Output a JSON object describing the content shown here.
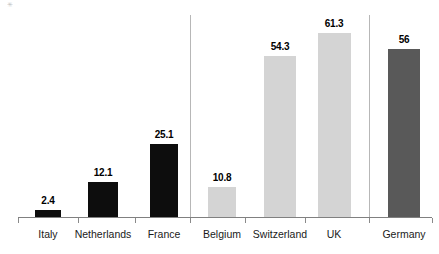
{
  "chart_data": {
    "type": "bar",
    "title": "",
    "subtitle": "",
    "xlabel": "",
    "ylabel": "",
    "ylim": [
      0,
      68
    ],
    "grid": false,
    "legend": "none",
    "categories": [
      "Italy",
      "Netherlands",
      "France",
      "Belgium",
      "Switzerland",
      "UK",
      "Germany"
    ],
    "values": [
      2.4,
      12.1,
      25.1,
      10.8,
      54.3,
      61.3,
      56
    ],
    "value_labels": [
      "2.4",
      "12.1",
      "25.1",
      "10.8",
      "54.3",
      "61.3",
      "56"
    ],
    "series": [
      {
        "name": "Value",
        "values": [
          2.4,
          12.1,
          25.1,
          10.8,
          54.3,
          61.3,
          56
        ]
      }
    ],
    "groups": [
      {
        "name": "group-1",
        "categories": [
          "Italy",
          "Netherlands",
          "France"
        ],
        "color": "#0d0d0d"
      },
      {
        "name": "group-2",
        "categories": [
          "Belgium",
          "Switzerland",
          "UK"
        ],
        "color": "#d4d4d4"
      },
      {
        "name": "group-3",
        "categories": [
          "Germany"
        ],
        "color": "#595959"
      }
    ],
    "bar_colors": [
      "#0d0d0d",
      "#0d0d0d",
      "#0d0d0d",
      "#d4d4d4",
      "#d4d4d4",
      "#d4d4d4",
      "#595959"
    ],
    "separators": [
      190,
      369
    ],
    "axis_color": "#808080",
    "separator_color": "#b7b7b7",
    "label_color": "#1a1a1a",
    "background": "#ffffff"
  },
  "bars": [
    {
      "label": "Italy",
      "value_label": "2.4",
      "x": 35,
      "width": 26,
      "top": 209,
      "color": "#0d0d0d",
      "label_x": 21,
      "label_w": 54,
      "label_y": 195
    },
    {
      "label": "Netherlands",
      "value_label": "12.1",
      "x": 88,
      "width": 30,
      "top": 181,
      "color": "#0d0d0d",
      "label_x": 76,
      "label_w": 54,
      "label_y": 167
    },
    {
      "label": "France",
      "value_label": "25.1",
      "x": 150,
      "width": 28,
      "top": 143,
      "color": "#0d0d0d",
      "label_x": 137,
      "label_w": 54,
      "label_y": 129
    },
    {
      "label": "Belgium",
      "value_label": "10.8",
      "x": 208,
      "width": 28,
      "top": 186,
      "color": "#d4d4d4",
      "label_x": 195,
      "label_w": 54,
      "label_y": 172
    },
    {
      "label": "Switzerland",
      "value_label": "54.3",
      "x": 264,
      "width": 32,
      "top": 55,
      "color": "#d4d4d4",
      "label_x": 253,
      "label_w": 54,
      "label_y": 41
    },
    {
      "label": "UK",
      "value_label": "61.3",
      "x": 318,
      "width": 33,
      "top": 32,
      "color": "#d4d4d4",
      "label_x": 307,
      "label_w": 54,
      "label_y": 18
    },
    {
      "label": "Germany",
      "value_label": "56",
      "x": 388,
      "width": 32,
      "top": 48,
      "color": "#595959",
      "label_x": 377,
      "label_w": 54,
      "label_y": 34
    }
  ],
  "category_labels": [
    {
      "text": "Italy",
      "x": 21,
      "w": 54
    },
    {
      "text": "Netherlands",
      "x": 69,
      "w": 68
    },
    {
      "text": "France",
      "x": 137,
      "w": 54
    },
    {
      "text": "Belgium",
      "x": 195,
      "w": 54
    },
    {
      "text": "Switzerland",
      "x": 246,
      "w": 68
    },
    {
      "text": "UK",
      "x": 307,
      "w": 54
    },
    {
      "text": "Germany",
      "x": 377,
      "w": 54
    }
  ],
  "separators": [
    {
      "x": 190,
      "top": 15,
      "height": 203
    },
    {
      "x": 369,
      "top": 15,
      "height": 203
    }
  ],
  "axis_ticks": [
    18,
    78,
    135,
    190,
    245,
    305,
    369,
    432
  ],
  "artifact": {
    "glyph": "✳"
  }
}
